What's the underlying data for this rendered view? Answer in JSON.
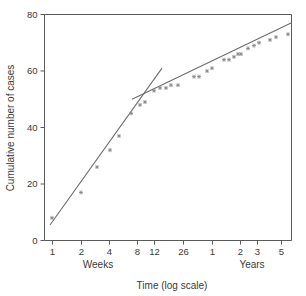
{
  "chart_data": {
    "type": "scatter",
    "title": "",
    "xlabel": "Time (log scale)",
    "ylabel": "Cumulative number of cases",
    "xscale": "log",
    "ylim": [
      0,
      80
    ],
    "yticks": [
      0,
      20,
      40,
      60,
      80
    ],
    "ytick_labels": [
      "0",
      "20",
      "40",
      "60",
      "80"
    ],
    "grid": false,
    "legend": null,
    "x_axis_groups": [
      {
        "label": "Weeks",
        "ticks": [
          "1",
          "2",
          "4",
          "8",
          "12",
          "26"
        ]
      },
      {
        "label": "Years",
        "ticks": [
          "1",
          "2",
          "3",
          "5"
        ]
      }
    ],
    "xtick_labels": [
      "1",
      "2",
      "4",
      "8",
      "12",
      "26",
      "1",
      "2",
      "3",
      "5"
    ],
    "xtick_px": [
      52,
      81,
      109,
      137,
      154,
      183,
      212,
      240,
      257,
      281
    ],
    "points": [
      {
        "x_px": 52,
        "value": 8
      },
      {
        "x_px": 81,
        "value": 17
      },
      {
        "x_px": 97,
        "value": 26
      },
      {
        "x_px": 110,
        "value": 32
      },
      {
        "x_px": 119,
        "value": 37
      },
      {
        "x_px": 131,
        "value": 45
      },
      {
        "x_px": 140,
        "value": 48
      },
      {
        "x_px": 145,
        "value": 49
      },
      {
        "x_px": 154,
        "value": 53
      },
      {
        "x_px": 160,
        "value": 54
      },
      {
        "x_px": 166,
        "value": 54
      },
      {
        "x_px": 171,
        "value": 55
      },
      {
        "x_px": 178,
        "value": 55
      },
      {
        "x_px": 194,
        "value": 58
      },
      {
        "x_px": 199,
        "value": 58
      },
      {
        "x_px": 207,
        "value": 60
      },
      {
        "x_px": 212,
        "value": 61
      },
      {
        "x_px": 224,
        "value": 64
      },
      {
        "x_px": 229,
        "value": 64
      },
      {
        "x_px": 234,
        "value": 65
      },
      {
        "x_px": 238,
        "value": 66
      },
      {
        "x_px": 241,
        "value": 66
      },
      {
        "x_px": 248,
        "value": 68
      },
      {
        "x_px": 254,
        "value": 69
      },
      {
        "x_px": 259,
        "value": 70
      },
      {
        "x_px": 270,
        "value": 71
      },
      {
        "x_px": 276,
        "value": 72
      },
      {
        "x_px": 288,
        "value": 73
      }
    ],
    "fit_lines": [
      {
        "name": "early-steep-fit",
        "x1_px": 50,
        "y1_value": 5.5,
        "x2_px": 162,
        "y2_value": 61
      },
      {
        "name": "late-shallow-fit",
        "x1_px": 132,
        "y1_value": 50,
        "x2_px": 291,
        "y2_value": 77
      }
    ],
    "marker_style": "small-asterisk",
    "colors": {
      "axis": "#5a5a5a",
      "line": "#6d6d6d",
      "marker": "#8a8a8a",
      "text": "#3a3a3a",
      "background": "#ffffff"
    }
  }
}
